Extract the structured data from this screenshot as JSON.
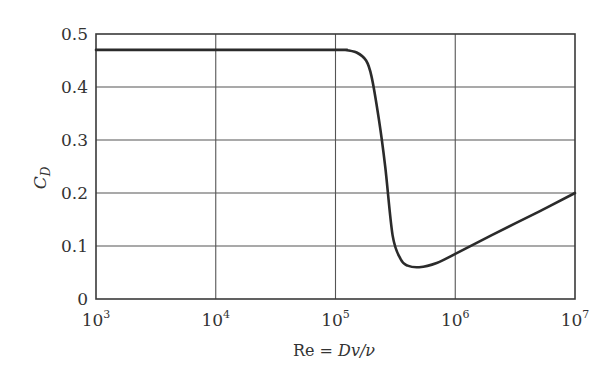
{
  "chart_data": {
    "type": "line",
    "title": "",
    "xlabel": "Re = Dv/ν",
    "xlabel_parts": {
      "pre": "Re = ",
      "ital": "Dv/ν"
    },
    "ylabel": "C_D",
    "ylabel_parts": {
      "main": "C",
      "sub": "D"
    },
    "x_scale": "log",
    "xlim": [
      1000,
      10000000
    ],
    "ylim": [
      0,
      0.5
    ],
    "grid": true,
    "legend": null,
    "x_ticks": [
      {
        "base": "10",
        "exp": "3",
        "value": 1000
      },
      {
        "base": "10",
        "exp": "4",
        "value": 10000
      },
      {
        "base": "10",
        "exp": "5",
        "value": 100000
      },
      {
        "base": "10",
        "exp": "6",
        "value": 1000000
      },
      {
        "base": "10",
        "exp": "7",
        "value": 10000000
      }
    ],
    "y_ticks": [
      "0",
      "0.1",
      "0.2",
      "0.3",
      "0.4",
      "0.5"
    ],
    "series": [
      {
        "name": "Drag coefficient of a sphere",
        "x": [
          1000,
          10000,
          100000,
          120000,
          150000,
          180000,
          200000,
          230000,
          260000,
          300000,
          350000,
          400000,
          500000,
          700000,
          1000000,
          2000000,
          5000000,
          10000000
        ],
        "y": [
          0.47,
          0.47,
          0.47,
          0.47,
          0.465,
          0.45,
          0.42,
          0.34,
          0.25,
          0.12,
          0.075,
          0.063,
          0.06,
          0.068,
          0.085,
          0.12,
          0.165,
          0.2
        ]
      }
    ]
  }
}
